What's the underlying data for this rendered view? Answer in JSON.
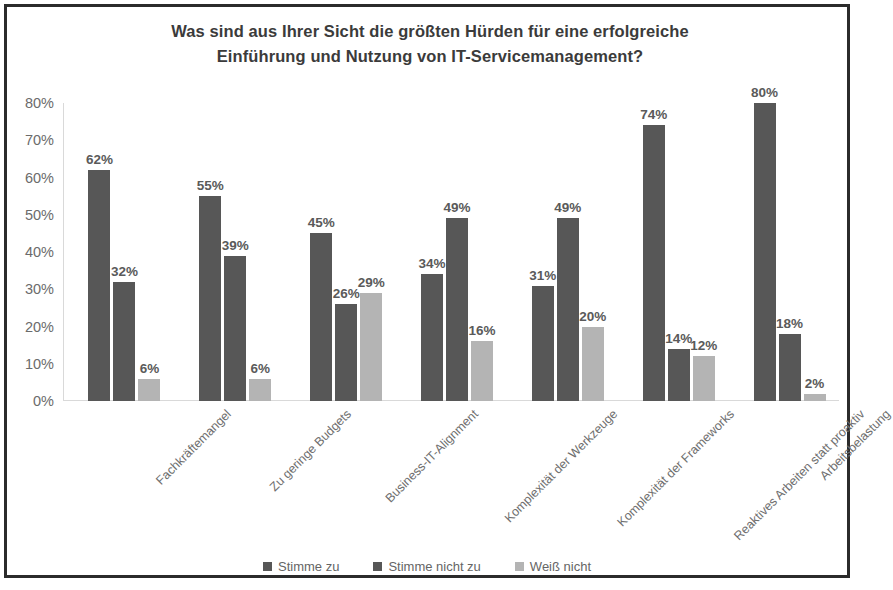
{
  "chart_data": {
    "type": "bar",
    "title": "Was sind aus Ihrer Sicht die größten Hürden für eine erfolgreiche Einführung und Nutzung von IT-Servicemanagement?",
    "title_line1": "Was sind aus Ihrer Sicht die größten Hürden für eine erfolgreiche",
    "title_line2": "Einführung und Nutzung von IT-Servicemanagement?",
    "xlabel": "",
    "ylabel": "",
    "ylim": [
      0,
      80
    ],
    "ytick_step": 10,
    "ytick_labels": [
      "0%",
      "10%",
      "20%",
      "30%",
      "40%",
      "50%",
      "60%",
      "70%",
      "80%"
    ],
    "ytick_values": [
      0,
      10,
      20,
      30,
      40,
      50,
      60,
      70,
      80
    ],
    "grid": false,
    "legend_position": "bottom",
    "value_suffix": "%",
    "categories": [
      "Fachkräftemangel",
      "Zu geringe Budgets",
      "Business-IT-Alignment",
      "Komplexität der Werkzeuge",
      "Komplexität der Frameworks",
      "Reaktives Arbeiten statt proaktiv",
      "Arbeitsbelastung"
    ],
    "series": [
      {
        "name": "Stimme zu",
        "color": "#575757",
        "values": [
          62,
          55,
          45,
          34,
          31,
          74,
          80
        ],
        "labels": [
          "62%",
          "55%",
          "45%",
          "34%",
          "31%",
          "74%",
          "80%"
        ]
      },
      {
        "name": "Stimme nicht zu",
        "color": "#575757",
        "values": [
          32,
          39,
          26,
          49,
          49,
          14,
          18
        ],
        "labels": [
          "32%",
          "39%",
          "26%",
          "49%",
          "49%",
          "14%",
          "18%"
        ]
      },
      {
        "name": "Weiß nicht",
        "color": "#b4b4b4",
        "values": [
          6,
          6,
          29,
          16,
          20,
          12,
          2
        ],
        "labels": [
          "6%",
          "6%",
          "29%",
          "16%",
          "20%",
          "12%",
          "2%"
        ]
      }
    ]
  },
  "frame": {
    "border_color": "#2b2b2b",
    "background": "#ffffff"
  }
}
